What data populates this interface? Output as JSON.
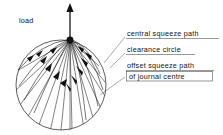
{
  "figure": {
    "type": "engineering-diagram"
  },
  "load_label": {
    "text": "load",
    "x": 19,
    "y": 23
  },
  "annotations": [
    {
      "id": "central-squeeze-path",
      "text": "central squeeze path",
      "x": 127,
      "y": 36,
      "underline": true,
      "boxed": false,
      "leader": {
        "x1": 125,
        "y1": 37,
        "x2": 104,
        "y2": 63
      }
    },
    {
      "id": "clearance-circle",
      "text": "clearance circle",
      "x": 127,
      "y": 52,
      "underline": true,
      "boxed": false,
      "leader": {
        "x1": 125,
        "y1": 53,
        "x2": 110,
        "y2": 68
      }
    },
    {
      "id": "offset-squeeze-path-line1",
      "text": "offset squeeze path",
      "x": 127,
      "y": 68,
      "underline": true,
      "boxed": false,
      "leader": {
        "x1": 125,
        "y1": 77,
        "x2": 100,
        "y2": 95
      }
    },
    {
      "id": "offset-squeeze-path-line2",
      "text": "of journal centre",
      "x": 129,
      "y": 77,
      "underline": false,
      "boxed": true
    }
  ],
  "geometry": {
    "circle": {
      "cx": 61,
      "cy": 85,
      "r": 45,
      "label": "clearance circle"
    },
    "hub": {
      "cx": 70,
      "cy": 40,
      "r": 3.4,
      "label": "journal centre at load"
    },
    "load_arrow": {
      "x": 70,
      "y_tail": 40,
      "y_tip": 5
    },
    "radial_line_count": 13,
    "curved_path_count": 8,
    "arrow_direction": "toward-hub"
  },
  "colors": {
    "ink": "#1a1a1a",
    "leader": "#555555",
    "background": "#ffffff"
  }
}
